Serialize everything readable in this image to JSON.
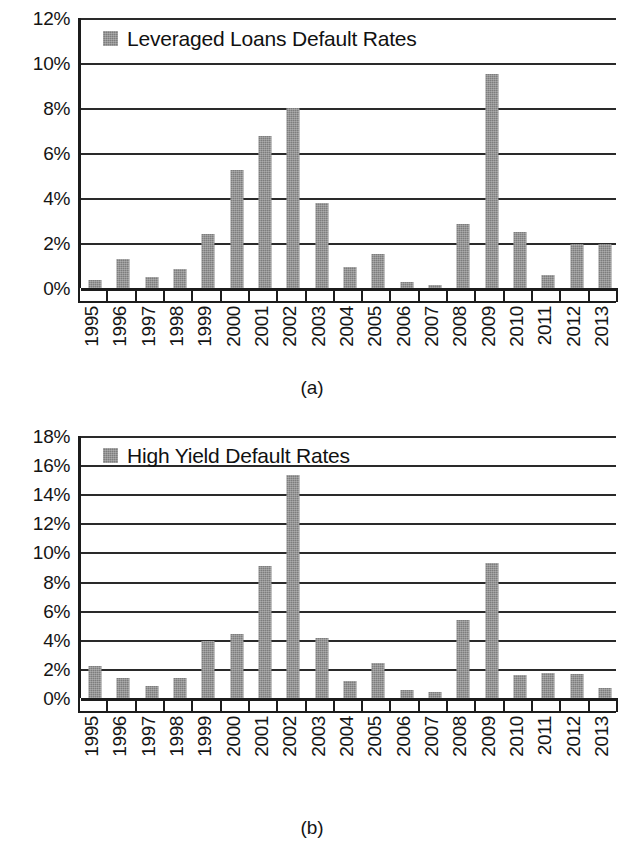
{
  "chart_data": [
    {
      "panel": "a",
      "type": "bar",
      "title": "",
      "xlabel": "",
      "ylabel": "",
      "legend": [
        "Leveraged Loans Default Rates"
      ],
      "legend_position": "top-left inside plot",
      "grid": true,
      "ylim": [
        0,
        12
      ],
      "yticks": [
        "0%",
        "2%",
        "4%",
        "6%",
        "8%",
        "10%",
        "12%"
      ],
      "ytick_values": [
        0,
        2,
        4,
        6,
        8,
        10,
        12
      ],
      "categories": [
        "1995",
        "1996",
        "1997",
        "1998",
        "1999",
        "2000",
        "2001",
        "2002",
        "2003",
        "2004",
        "2005",
        "2006",
        "2007",
        "2008",
        "2009",
        "2010",
        "2011",
        "2012",
        "2013"
      ],
      "values": [
        0.35,
        1.3,
        0.5,
        0.85,
        2.4,
        5.25,
        6.75,
        8.0,
        3.8,
        0.95,
        1.5,
        0.25,
        0.15,
        2.85,
        9.5,
        2.5,
        0.6,
        1.95,
        1.95
      ],
      "series": [
        {
          "name": "Leveraged Loans Default Rates",
          "values": [
            0.35,
            1.3,
            0.5,
            0.85,
            2.4,
            5.25,
            6.75,
            8.0,
            3.8,
            0.95,
            1.5,
            0.25,
            0.15,
            2.85,
            9.5,
            2.5,
            0.6,
            1.95,
            1.95
          ]
        }
      ],
      "caption": "(a)",
      "bar_color": "#7d7d7d"
    },
    {
      "panel": "b",
      "type": "bar",
      "title": "",
      "xlabel": "",
      "ylabel": "",
      "legend": [
        "High Yield Default Rates"
      ],
      "legend_position": "top-left inside plot",
      "grid": true,
      "ylim": [
        0,
        18
      ],
      "yticks": [
        "0%",
        "2%",
        "4%",
        "6%",
        "8%",
        "10%",
        "12%",
        "14%",
        "16%",
        "18%"
      ],
      "ytick_values": [
        0,
        2,
        4,
        6,
        8,
        10,
        12,
        14,
        16,
        18
      ],
      "categories": [
        "1995",
        "1996",
        "1997",
        "1998",
        "1999",
        "2000",
        "2001",
        "2002",
        "2003",
        "2004",
        "2005",
        "2006",
        "2007",
        "2008",
        "2009",
        "2010",
        "2011",
        "2012",
        "2013"
      ],
      "values": [
        2.2,
        1.35,
        0.85,
        1.35,
        3.95,
        4.4,
        9.1,
        15.35,
        4.1,
        1.2,
        2.4,
        0.55,
        0.4,
        5.35,
        9.25,
        1.55,
        1.75,
        1.65,
        0.7
      ],
      "series": [
        {
          "name": "High Yield Default Rates",
          "values": [
            2.2,
            1.35,
            0.85,
            1.35,
            3.95,
            4.4,
            9.1,
            15.35,
            4.1,
            1.2,
            2.4,
            0.55,
            0.4,
            5.35,
            9.25,
            1.55,
            1.75,
            1.65,
            0.7
          ]
        }
      ],
      "caption": "(b)",
      "bar_color": "#7d7d7d"
    }
  ],
  "figure_a": {
    "legend_label": "Leveraged Loans Default Rates",
    "caption": "(a)"
  },
  "figure_b": {
    "legend_label": "High Yield Default Rates",
    "caption": "(b)"
  }
}
